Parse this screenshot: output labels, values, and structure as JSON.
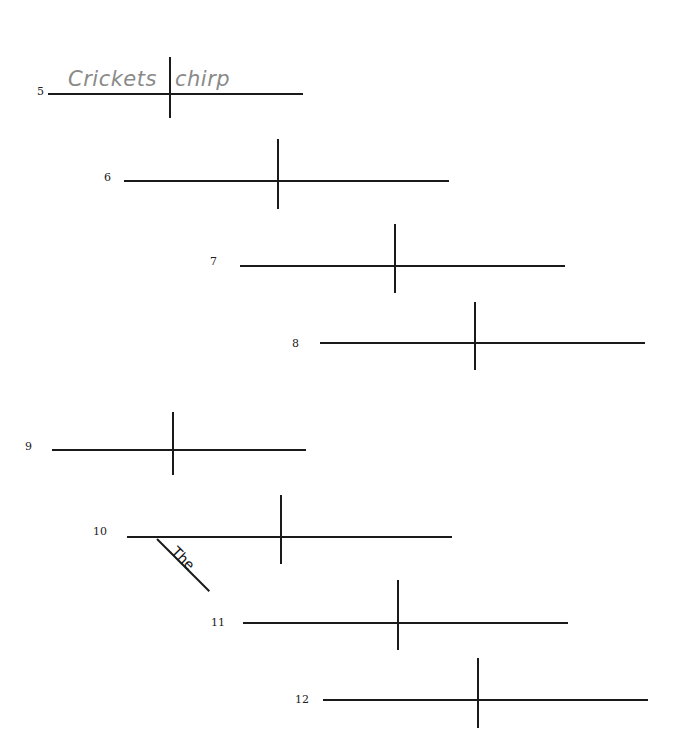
{
  "worksheet": {
    "type": "sentence-diagram-practice",
    "line_color": "#1a1a1a",
    "handwriting_color": "#8a8a8a",
    "items": [
      {
        "number": "5",
        "label_pos": [
          37,
          86
        ],
        "baseline": {
          "x1": 48,
          "x2": 303,
          "y": 94
        },
        "divider": {
          "x": 170,
          "y1": 57,
          "y2": 118
        },
        "subject": "Crickets",
        "predicate": "chirp"
      },
      {
        "number": "6",
        "label_pos": [
          104,
          172
        ],
        "baseline": {
          "x1": 124,
          "x2": 449,
          "y": 181
        },
        "divider": {
          "x": 278,
          "y1": 139,
          "y2": 209
        }
      },
      {
        "number": "7",
        "label_pos": [
          210,
          256
        ],
        "baseline": {
          "x1": 240,
          "x2": 565,
          "y": 266
        },
        "divider": {
          "x": 395,
          "y1": 224,
          "y2": 293
        }
      },
      {
        "number": "8",
        "label_pos": [
          292,
          338
        ],
        "baseline": {
          "x1": 320,
          "x2": 645,
          "y": 343
        },
        "divider": {
          "x": 475,
          "y1": 302,
          "y2": 370
        }
      },
      {
        "number": "9",
        "label_pos": [
          25,
          441
        ],
        "baseline": {
          "x1": 52,
          "x2": 306,
          "y": 450
        },
        "divider": {
          "x": 173,
          "y1": 412,
          "y2": 475
        }
      },
      {
        "number": "10",
        "label_pos": [
          93,
          526
        ],
        "baseline": {
          "x1": 127,
          "x2": 452,
          "y": 537
        },
        "divider": {
          "x": 281,
          "y1": 495,
          "y2": 564
        },
        "modifier": {
          "word": "The",
          "x1": 157,
          "y1": 538,
          "x2": 209,
          "y2": 590
        }
      },
      {
        "number": "11",
        "label_pos": [
          211,
          617
        ],
        "baseline": {
          "x1": 243,
          "x2": 568,
          "y": 623
        },
        "divider": {
          "x": 398,
          "y1": 580,
          "y2": 650
        }
      },
      {
        "number": "12",
        "label_pos": [
          295,
          694
        ],
        "baseline": {
          "x1": 323,
          "x2": 648,
          "y": 700
        },
        "divider": {
          "x": 478,
          "y1": 658,
          "y2": 728
        }
      }
    ]
  }
}
